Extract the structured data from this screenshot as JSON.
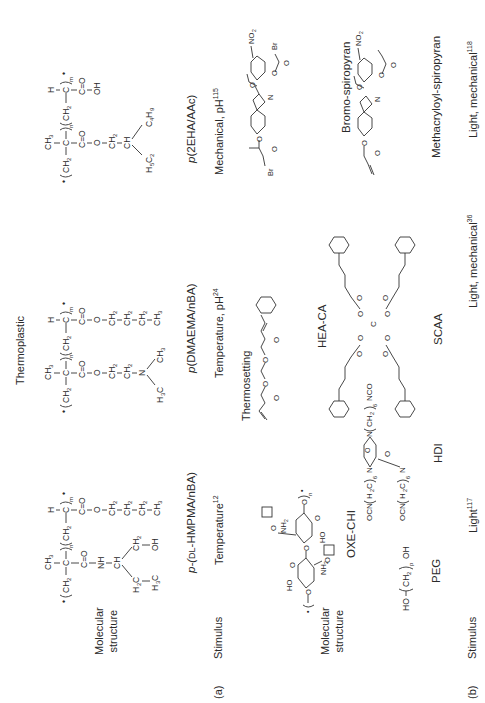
{
  "figure": {
    "section_headers": {
      "thermoplastic": "Thermoplastic",
      "thermosetting": "Thermosetting"
    },
    "panel_a": {
      "panel_label": "(a)",
      "row_label_structure": [
        "Molecular",
        "structure"
      ],
      "row_label_stimulus": "Stimulus",
      "columns": [
        {
          "name_prefix": "p-(",
          "name_smallcaps": "DL",
          "name_suffix": "-HMPMA/nBA)",
          "stimulus": "Temperature",
          "ref": "12",
          "structure_text": [
            "CH3",
            "CH2",
            "C",
            "C=O",
            "NH",
            "CH",
            "H2C",
            "H3C",
            "CH2",
            "OH",
            "n",
            "CH2",
            "H",
            "C",
            "C=O",
            "O",
            "CH2",
            "CH2",
            "CH2",
            "CH3",
            "m"
          ]
        },
        {
          "name_prefix": "p",
          "name_rest": "(DMAEMA/nBA)",
          "stimulus": "Temperature, pH",
          "ref": "24",
          "structure_text": [
            "CH3",
            "CH2",
            "C",
            "C=O",
            "O",
            "CH2",
            "CH2",
            "N",
            "CH3",
            "H3C",
            "n",
            "CH2",
            "H",
            "C",
            "C=O",
            "O",
            "CH2",
            "CH2",
            "CH2",
            "CH3",
            "m"
          ]
        },
        {
          "name_prefix": "p",
          "name_rest": "(2EHA/AAc)",
          "stimulus": "Mechanical, pH",
          "ref": "115",
          "structure_text": [
            "CH3",
            "CH2",
            "C",
            "C=O",
            "O",
            "CH2",
            "CH",
            "H5C2",
            "C4H9",
            "n",
            "CH2",
            "H",
            "C",
            "C=O",
            "OH",
            "m"
          ]
        }
      ]
    },
    "panel_b": {
      "panel_label": "(b)",
      "row_label_structure": [
        "Molecular",
        "structure"
      ],
      "row_label_stimulus": "Stimulus",
      "groups": [
        {
          "compounds": [
            {
              "name": "OXE-CHI",
              "structure_text": [
                "HO",
                "O",
                "NH2",
                "O",
                "O",
                "HO",
                "NH2",
                "O",
                "O",
                "n"
              ]
            },
            {
              "name": "PEG",
              "structure_text": [
                "HO",
                "CH2",
                "p",
                "OH"
              ]
            },
            {
              "name": "HDI",
              "structure_text": [
                "OCN",
                "H2C",
                "6",
                "N",
                "O",
                "N",
                "O",
                "N",
                "O",
                "CH2",
                "6",
                "NCO",
                "OCN",
                "H2C",
                "6"
              ]
            }
          ],
          "stimulus": "Light",
          "ref": "117"
        },
        {
          "compounds": [
            {
              "name": "HEA-CA",
              "structure_text": [
                "O",
                "O",
                "O",
                "O"
              ]
            },
            {
              "name": "SCAA",
              "structure_text": [
                "O",
                "O",
                "O",
                "O",
                "O",
                "O",
                "O",
                "O"
              ]
            }
          ],
          "stimulus": "Light, mechanical",
          "ref": "36"
        },
        {
          "compounds": [
            {
              "name": "Bromo-spiropyran",
              "structure_text": [
                "NO2",
                "O",
                "O",
                "Br",
                "N",
                "O",
                "O",
                "Br"
              ]
            },
            {
              "name": "Methacryloyl-spiropyran",
              "structure_text": [
                "NO2",
                "O",
                "O",
                "N",
                "O",
                "O"
              ]
            }
          ],
          "stimulus": "Light, mechanical",
          "ref": "118"
        }
      ]
    }
  }
}
